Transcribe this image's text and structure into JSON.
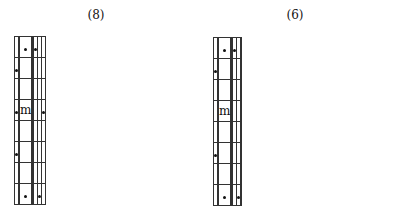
{
  "panels": [
    {
      "title": "(8)",
      "rows": 8,
      "cols": 8,
      "marks": [
        {
          "row": 0,
          "col": 2,
          "type": "star"
        },
        {
          "row": 0,
          "col": 5,
          "type": "star"
        },
        {
          "row": 1,
          "col": 0,
          "type": "star"
        },
        {
          "row": 3,
          "col": 0,
          "type": "star"
        },
        {
          "row": 3,
          "col": 2,
          "type": "letter",
          "text": "m"
        },
        {
          "row": 3,
          "col": 7,
          "type": "star"
        },
        {
          "row": 5,
          "col": 0,
          "type": "star"
        },
        {
          "row": 7,
          "col": 2,
          "type": "star"
        },
        {
          "row": 7,
          "col": 6,
          "type": "star"
        }
      ]
    },
    {
      "title": "(6)",
      "rows": 8,
      "cols": 8,
      "marks": [
        {
          "row": 0,
          "col": 2,
          "type": "star"
        },
        {
          "row": 0,
          "col": 5,
          "type": "star"
        },
        {
          "row": 1,
          "col": 0,
          "type": "star"
        },
        {
          "row": 3,
          "col": 2,
          "type": "letter",
          "text": "m"
        },
        {
          "row": 5,
          "col": 0,
          "type": "star"
        },
        {
          "row": 7,
          "col": 2,
          "type": "star"
        },
        {
          "row": 7,
          "col": 6,
          "type": "star"
        }
      ]
    }
  ]
}
